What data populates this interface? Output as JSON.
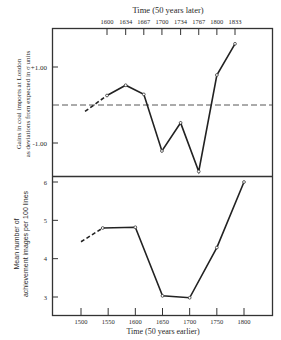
{
  "chart_data": [
    {
      "type": "line",
      "panel": "top",
      "title": "Time (50 years later)",
      "xlabel": "Time (50 years later)",
      "ylabel": "Gains in coal imports at London as deviations from expected in σ units",
      "ylabel_lines": [
        "Gains in coal imports at London",
        "as deviations from expected in σ units"
      ],
      "x_ticks": [
        1600,
        1634,
        1667,
        1700,
        1734,
        1767,
        1800,
        1833
      ],
      "y_ticks": [
        {
          "value": 1.0,
          "label": "+1.00"
        },
        {
          "value": -1.0,
          "label": "-1.00"
        }
      ],
      "reference_line": {
        "y": 0,
        "style": "dashed"
      },
      "ylim": [
        -2.0,
        2.1
      ],
      "series": [
        {
          "name": "Coal imports deviation",
          "x": [
            1560,
            1600,
            1634,
            1667,
            1700,
            1734,
            1767,
            1800,
            1833
          ],
          "values": [
            -0.17,
            0.25,
            0.52,
            0.28,
            -1.21,
            -0.47,
            -1.75,
            0.79,
            1.61
          ],
          "dashed_segment_until_index": 1
        }
      ],
      "grid": false,
      "legend": null
    },
    {
      "type": "line",
      "panel": "bottom",
      "xlabel": "Time (50 years earlier)",
      "ylabel": "Mean number of achievement images per 100 lines",
      "ylabel_lines": [
        "Mean number of",
        "achievement images per 100 lines"
      ],
      "x_ticks": [
        1500,
        1550,
        1600,
        1650,
        1700,
        1750,
        1800
      ],
      "y_ticks": [
        {
          "value": 6,
          "label": "6"
        },
        {
          "value": 5,
          "label": "5"
        },
        {
          "value": 4,
          "label": "4"
        },
        {
          "value": 3,
          "label": "3"
        }
      ],
      "ylim": [
        2.55,
        6.15
      ],
      "series": [
        {
          "name": "Achievement imagery",
          "x": [
            1500,
            1540,
            1600,
            1650,
            1700,
            1750,
            1800
          ],
          "values": [
            4.44,
            4.8,
            4.82,
            3.03,
            2.98,
            4.29,
            6.0
          ],
          "dashed_segment_until_index": 1
        }
      ],
      "grid": false,
      "legend": null
    }
  ],
  "labels": {
    "top_axis_title": "Time (50 years later)",
    "bottom_axis_title": "Time (50 years earlier)",
    "top_ylabel_line1": "Gains in coal imports at London",
    "top_ylabel_line2": "as deviations from expected in σ units",
    "bottom_ylabel_line1": "Mean number of",
    "bottom_ylabel_line2": "achievement images per 100 lines"
  }
}
